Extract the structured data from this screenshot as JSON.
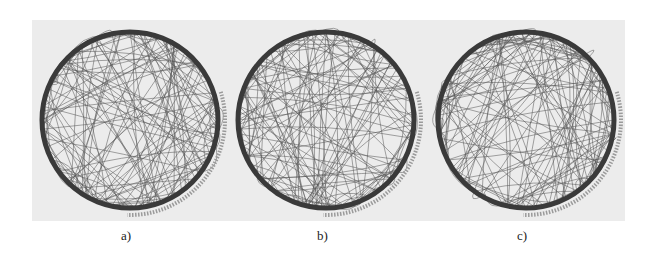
{
  "figure": {
    "panel_color": "#ececec",
    "ring_color": "#3a3a3a",
    "edge_color": "#555555",
    "subfigures": [
      {
        "label": "a)",
        "cx": 130,
        "cy": 120,
        "r": 88,
        "seed": 11
      },
      {
        "label": "b)",
        "cx": 326,
        "cy": 120,
        "r": 88,
        "seed": 23
      },
      {
        "label": "c)",
        "cx": 526,
        "cy": 120,
        "r": 88,
        "seed": 37
      }
    ]
  }
}
